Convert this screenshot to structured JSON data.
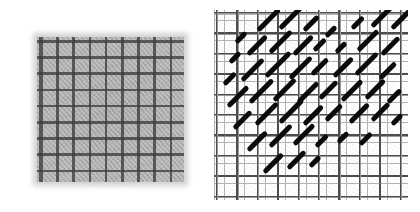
{
  "figure": {
    "name": "two-panel-micrograph-figure",
    "background_color": "#ffffff",
    "width": 420,
    "height": 212,
    "caption": "",
    "panels": [
      {
        "id": "left",
        "label": "",
        "name": "woven-mesh-micrograph",
        "description": "Grayscale micrograph of a woven square mesh grid with a translucent grey specimen film covering the central region",
        "background_color": "#ffffff",
        "mesh": {
          "pitch_px": 8.1,
          "opening_px": 4.6,
          "wire_color": "#111111",
          "gap_color": "#ffffff",
          "origin_x": 10,
          "origin_y": 8,
          "width": 196,
          "height": 198
        },
        "film": {
          "color": "#aaaaaa",
          "opacity": 0.8,
          "left": 27,
          "top": 29,
          "width": 147,
          "height": 145,
          "cross_color": "#282828",
          "cross_pitch_px": 16.2
        }
      },
      {
        "id": "right",
        "label": "",
        "name": "binarised-orientation-map",
        "description": "Binarised / thresholded version of the same field showing the open grid as thin grey lines and detected features as thick black 45 degree strokes",
        "background_color": "#ffffff",
        "grid": {
          "pitch_px": 20.4,
          "line_color": "#4a4a4a",
          "secondary_line_color": "#777777",
          "origin_x": 6,
          "origin_y": 10,
          "width": 194,
          "height": 190
        },
        "strokes": {
          "color": "#0b0b0b",
          "angle_deg": -45,
          "thickness_px": 5,
          "count": 78
        }
      }
    ]
  },
  "chart_data": {
    "type": "scatter",
    "title": "",
    "subtitle": "",
    "xlabel": "",
    "ylabel": "",
    "grid": true,
    "legend": null,
    "panels": [
      {
        "name": "left-micrograph",
        "type": "heatmap",
        "description": "grayscale image, no axes",
        "xlim": [
          0,
          196
        ],
        "ylim": [
          0,
          198
        ]
      },
      {
        "name": "right-stroke-map",
        "type": "scatter",
        "description": "oriented line segments at -45 degrees on a 20.4 px grid",
        "xlim": [
          0,
          194
        ],
        "ylim": [
          0,
          190
        ],
        "angle_deg": -45,
        "segments": [
          {
            "x": 22,
            "y": 32,
            "len": 14
          },
          {
            "x": 44,
            "y": 20,
            "len": 30
          },
          {
            "x": 66,
            "y": 18,
            "len": 32
          },
          {
            "x": 90,
            "y": 20,
            "len": 20
          },
          {
            "x": 112,
            "y": 26,
            "len": 14
          },
          {
            "x": 138,
            "y": 18,
            "len": 16
          },
          {
            "x": 158,
            "y": 16,
            "len": 30
          },
          {
            "x": 178,
            "y": 18,
            "len": 26
          },
          {
            "x": 16,
            "y": 52,
            "len": 14
          },
          {
            "x": 34,
            "y": 44,
            "len": 26
          },
          {
            "x": 56,
            "y": 42,
            "len": 30
          },
          {
            "x": 80,
            "y": 44,
            "len": 26
          },
          {
            "x": 100,
            "y": 40,
            "len": 16
          },
          {
            "x": 122,
            "y": 42,
            "len": 14
          },
          {
            "x": 144,
            "y": 40,
            "len": 28
          },
          {
            "x": 168,
            "y": 44,
            "len": 24
          },
          {
            "x": 10,
            "y": 74,
            "len": 16
          },
          {
            "x": 28,
            "y": 70,
            "len": 30
          },
          {
            "x": 52,
            "y": 66,
            "len": 34
          },
          {
            "x": 76,
            "y": 68,
            "len": 30
          },
          {
            "x": 98,
            "y": 64,
            "len": 22
          },
          {
            "x": 120,
            "y": 66,
            "len": 26
          },
          {
            "x": 142,
            "y": 64,
            "len": 30
          },
          {
            "x": 166,
            "y": 68,
            "len": 22
          },
          {
            "x": 14,
            "y": 96,
            "len": 28
          },
          {
            "x": 36,
            "y": 92,
            "len": 32
          },
          {
            "x": 60,
            "y": 90,
            "len": 30
          },
          {
            "x": 84,
            "y": 92,
            "len": 28
          },
          {
            "x": 106,
            "y": 88,
            "len": 24
          },
          {
            "x": 128,
            "y": 90,
            "len": 28
          },
          {
            "x": 152,
            "y": 88,
            "len": 26
          },
          {
            "x": 174,
            "y": 92,
            "len": 18
          },
          {
            "x": 20,
            "y": 118,
            "len": 24
          },
          {
            "x": 42,
            "y": 114,
            "len": 30
          },
          {
            "x": 66,
            "y": 112,
            "len": 32
          },
          {
            "x": 90,
            "y": 114,
            "len": 26
          },
          {
            "x": 112,
            "y": 110,
            "len": 22
          },
          {
            "x": 136,
            "y": 112,
            "len": 26
          },
          {
            "x": 158,
            "y": 110,
            "len": 24
          },
          {
            "x": 178,
            "y": 114,
            "len": 14
          },
          {
            "x": 34,
            "y": 140,
            "len": 26
          },
          {
            "x": 56,
            "y": 136,
            "len": 30
          },
          {
            "x": 80,
            "y": 134,
            "len": 28
          },
          {
            "x": 102,
            "y": 136,
            "len": 16
          },
          {
            "x": 124,
            "y": 132,
            "len": 14
          },
          {
            "x": 146,
            "y": 134,
            "len": 16
          },
          {
            "x": 50,
            "y": 162,
            "len": 26
          },
          {
            "x": 74,
            "y": 158,
            "len": 24
          },
          {
            "x": 96,
            "y": 156,
            "len": 14
          }
        ]
      }
    ]
  }
}
